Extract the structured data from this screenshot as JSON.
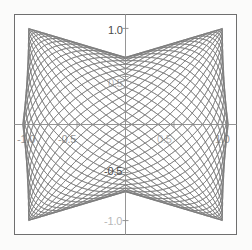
{
  "figure": {
    "kind": "parametric-curve-family",
    "frame_color": "#6f6f6f",
    "axis_color": "#8a8a8a",
    "curve_color": "#7a7a7a",
    "background": "#ffffff"
  },
  "chart_data": {
    "type": "line",
    "title": "",
    "xlabel": "",
    "ylabel": "",
    "xlim": [
      -1.15,
      1.15
    ],
    "ylim": [
      -1.15,
      1.15
    ],
    "grid": false,
    "legend": "none",
    "axes": {
      "x_ticks": [
        -1.0,
        -0.5,
        0.5,
        1.0
      ],
      "x_tick_labels": [
        "-1.0",
        "-0.5",
        "0.5",
        "1.0"
      ],
      "y_ticks": [
        -1.0,
        -0.5,
        0.5,
        1.0
      ],
      "y_tick_labels": [
        "-1.0",
        "-0.5",
        "0.5",
        "1.0"
      ],
      "x_axis_at_y": 0,
      "y_axis_at_x": 0,
      "spines": "centered-cross"
    },
    "series_count": 24,
    "param": {
      "x": "cos(t)",
      "y": "cos(t - phi) ... family swept over phi",
      "t_range": [
        0,
        6.283185307179586
      ],
      "phi_start": 0.06,
      "phi_end": 3.08,
      "samples_per_curve": 220
    },
    "series": [
      {
        "name": "phi_01",
        "phi": 0.06
      },
      {
        "name": "phi_02",
        "phi": 0.191
      },
      {
        "name": "phi_03",
        "phi": 0.322
      },
      {
        "name": "phi_04",
        "phi": 0.454
      },
      {
        "name": "phi_05",
        "phi": 0.585
      },
      {
        "name": "phi_06",
        "phi": 0.716
      },
      {
        "name": "phi_07",
        "phi": 0.848
      },
      {
        "name": "phi_08",
        "phi": 0.979
      },
      {
        "name": "phi_09",
        "phi": 1.11
      },
      {
        "name": "phi_10",
        "phi": 1.241
      },
      {
        "name": "phi_11",
        "phi": 1.373
      },
      {
        "name": "phi_12",
        "phi": 1.504
      },
      {
        "name": "phi_13",
        "phi": 1.635
      },
      {
        "name": "phi_14",
        "phi": 1.767
      },
      {
        "name": "phi_15",
        "phi": 1.898
      },
      {
        "name": "phi_16",
        "phi": 2.029
      },
      {
        "name": "phi_17",
        "phi": 2.16
      },
      {
        "name": "phi_18",
        "phi": 2.292
      },
      {
        "name": "phi_19",
        "phi": 2.423
      },
      {
        "name": "phi_20",
        "phi": 2.554
      },
      {
        "name": "phi_21",
        "phi": 2.686
      },
      {
        "name": "phi_22",
        "phi": 2.817
      },
      {
        "name": "phi_23",
        "phi": 2.948
      },
      {
        "name": "phi_24",
        "phi": 3.08
      }
    ]
  },
  "labels": {
    "y_top": "1.0",
    "y_upper_mid": "0.5",
    "y_lower_mid": "-0.5",
    "y_bottom": "-1.0",
    "x_left": "-1.0",
    "x_left_mid": "-0.5",
    "x_right_mid": "0.5",
    "x_right": "1.0"
  }
}
